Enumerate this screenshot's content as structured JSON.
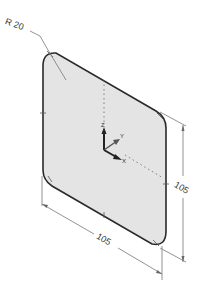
{
  "drawing": {
    "type": "isometric-part-view",
    "part": "rounded-square-plate",
    "colors": {
      "background": "#ffffff",
      "face_fill": "#e4e4e4",
      "outline": "#2a2a2a",
      "dimension_line": "#777777",
      "text": "#333333"
    },
    "annotations": {
      "radius_label": "R 20",
      "width_dim": "105",
      "height_dim": "105"
    },
    "triad": {
      "z_label": "Z",
      "y_label": "Y",
      "x_label": "X"
    }
  }
}
